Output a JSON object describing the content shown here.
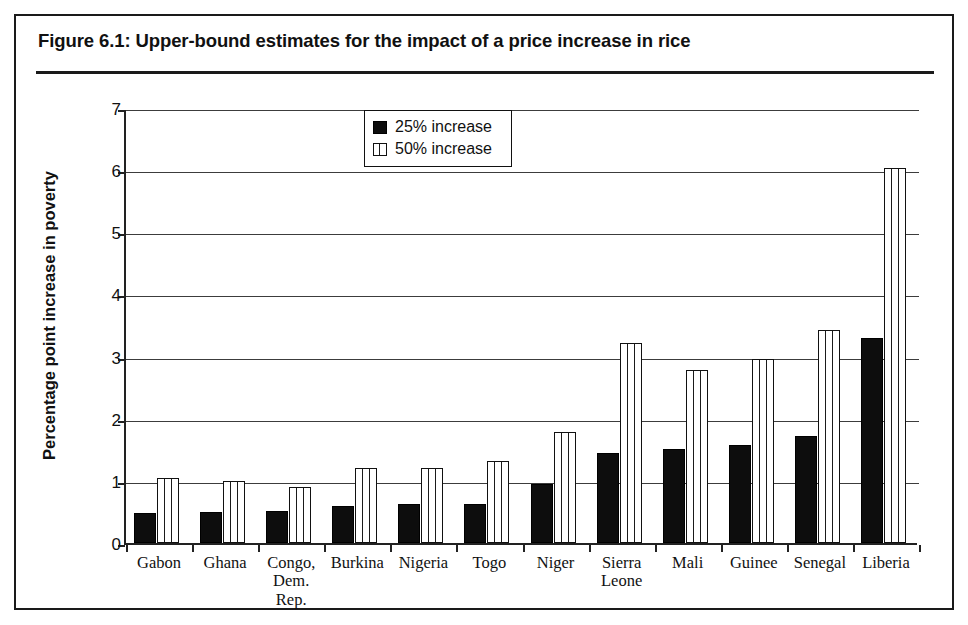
{
  "figure": {
    "title": "Figure 6.1:  Upper-bound estimates for the impact of a price increase in rice"
  },
  "legend": {
    "position": "inside-top-center",
    "entries": [
      {
        "label": "25% increase",
        "swatch": "solid-black-square-icon",
        "color": "#0d0d0d"
      },
      {
        "label": "50% increase",
        "swatch": "white-vertical-hatch-square-icon",
        "color": "#ffffff"
      }
    ]
  },
  "chart_data": {
    "type": "bar",
    "title": "Figure 6.1:  Upper-bound estimates for the impact of a price increase in rice",
    "xlabel": "",
    "ylabel": "Percentage point increase in poverty",
    "ylim": [
      0,
      7
    ],
    "yticks": [
      0,
      1,
      2,
      3,
      4,
      5,
      6,
      7
    ],
    "ytick_labels": [
      "0",
      "1",
      "2",
      "3",
      "4",
      "5",
      "6",
      "7"
    ],
    "grid": true,
    "grid_axis": "y",
    "legend_position": "upper center (inside plot)",
    "categories": [
      "Gabon",
      "Ghana",
      "Congo, Dem. Rep.",
      "Burkina",
      "Nigeria",
      "Togo",
      "Niger",
      "Sierra Leone",
      "Mali",
      "Guinee",
      "Senegal",
      "Liberia"
    ],
    "category_labels_multiline": [
      [
        "Gabon"
      ],
      [
        "Ghana"
      ],
      [
        "Congo,",
        "Dem. Rep."
      ],
      [
        "Burkina"
      ],
      [
        "Nigeria"
      ],
      [
        "Togo"
      ],
      [
        "Niger"
      ],
      [
        "Sierra",
        "Leone"
      ],
      [
        "Mali"
      ],
      [
        "Guinee"
      ],
      [
        "Senegal"
      ],
      [
        "Liberia"
      ]
    ],
    "series": [
      {
        "name": "25% increase",
        "color": "#0d0d0d",
        "values": [
          0.48,
          0.5,
          0.51,
          0.6,
          0.62,
          0.63,
          0.95,
          1.45,
          1.51,
          1.58,
          1.73,
          3.3
        ]
      },
      {
        "name": "50% increase",
        "color": "#ffffff",
        "values": [
          1.04,
          0.99,
          0.9,
          1.21,
          1.21,
          1.32,
          1.78,
          3.22,
          2.78,
          2.96,
          3.43,
          6.04
        ]
      }
    ]
  }
}
